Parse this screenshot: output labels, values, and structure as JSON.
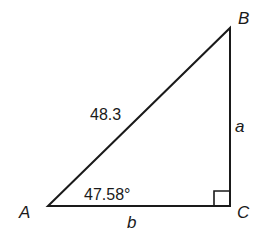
{
  "diagram": {
    "type": "right-triangle",
    "vertices": {
      "A": {
        "label": "A",
        "x": 48,
        "y": 206
      },
      "B": {
        "label": "B",
        "x": 230,
        "y": 28
      },
      "C": {
        "label": "C",
        "x": 230,
        "y": 206
      }
    },
    "sides": {
      "hypotenuse": {
        "label": "48.3"
      },
      "a": {
        "label": "a"
      },
      "b": {
        "label": "b"
      }
    },
    "angle_A": {
      "label": "47.58°"
    },
    "right_angle_at": "C",
    "stroke_color": "#1a1a1a"
  }
}
